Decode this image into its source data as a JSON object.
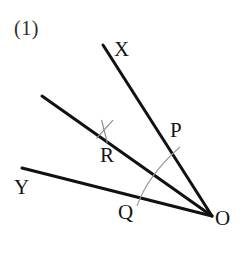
{
  "figure": {
    "item_number": "(1)",
    "background_color": "#ffffff",
    "ink_color": "#111111",
    "arc_color": "#9a9a9a",
    "tick_color": "#8d8d8d",
    "vertex": {
      "name": "O",
      "label": "O",
      "x": 212,
      "y": 216
    },
    "rays": [
      {
        "name": "ray-OX",
        "label": "X",
        "from_label": "O",
        "to_label": "X",
        "x1": 212,
        "y1": 216,
        "x2": 103,
        "y2": 45,
        "stroke_width": 3.0
      },
      {
        "name": "ray-OR",
        "label": "R",
        "from_label": "O",
        "to_label": "R",
        "x1": 212,
        "y1": 216,
        "x2": 42,
        "y2": 96,
        "stroke_width": 3.0
      },
      {
        "name": "ray-OY",
        "label": "Y",
        "from_label": "O",
        "to_label": "Y",
        "x1": 212,
        "y1": 216,
        "x2": 22,
        "y2": 168,
        "stroke_width": 3.0
      }
    ],
    "arc": {
      "name": "angle-arc-POQ",
      "center_x": 212,
      "center_y": 216,
      "radius": 76,
      "start_x": 180,
      "start_y": 147,
      "mid_x": 156,
      "mid_y": 173,
      "end_x": 137,
      "end_y": 206,
      "stroke_width": 1.1
    },
    "tick_mark": {
      "name": "congruence-tick-R",
      "center_x": 105,
      "center_y": 132,
      "size": 11,
      "stroke_width": 1.2
    },
    "points": [
      {
        "name": "point-X",
        "label": "X",
        "x": 114,
        "y": 39
      },
      {
        "name": "point-P",
        "label": "P",
        "x": 170,
        "y": 120
      },
      {
        "name": "point-R",
        "label": "R",
        "x": 100,
        "y": 145
      },
      {
        "name": "point-Y",
        "label": "Y",
        "x": 14,
        "y": 177
      },
      {
        "name": "point-Q",
        "label": "Q",
        "x": 118,
        "y": 202
      },
      {
        "name": "point-O",
        "label": "O",
        "x": 215,
        "y": 208
      }
    ]
  }
}
